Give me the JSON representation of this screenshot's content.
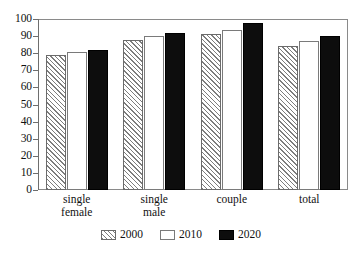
{
  "chart_data": {
    "type": "bar",
    "title": "",
    "subtitle": "",
    "xlabel": "",
    "ylabel": "",
    "categories": [
      "single\nfemale",
      "single\nmale",
      "couple",
      "total"
    ],
    "series": [
      {
        "name": "2000",
        "values": [
          79,
          87.5,
          91,
          84.5
        ],
        "style": "hatched",
        "color": "#ffffff",
        "hatch_color": "#7d7d7d",
        "border": "#6b6b6b"
      },
      {
        "name": "2010",
        "values": [
          80.5,
          90,
          93.5,
          87
        ],
        "style": "open",
        "color": "#ffffff",
        "border": "#7a7a7a"
      },
      {
        "name": "2020",
        "values": [
          82,
          92,
          97.5,
          90
        ],
        "style": "solid",
        "color": "#0d0d0d",
        "border": "#000000"
      }
    ],
    "ylim": [
      0,
      100
    ],
    "ytick_step": 10,
    "yticks": [
      0,
      10,
      20,
      30,
      40,
      50,
      60,
      70,
      80,
      90,
      100
    ],
    "ytick_labels": [
      "0",
      "10",
      "20",
      "30",
      "40",
      "50",
      "60",
      "70",
      "80",
      "90",
      "100"
    ],
    "grid": false,
    "legend_position": "bottom-center",
    "legend_entries": [
      "2000",
      "2010",
      "2020"
    ],
    "frame": true,
    "annotations": []
  },
  "axis": {
    "y": {
      "labels": [
        "100",
        "90",
        "80",
        "70",
        "60",
        "50",
        "40",
        "30",
        "20",
        "10",
        "0"
      ]
    },
    "x": {
      "group_labels": [
        "single\nfemale",
        "single\nmale",
        "couple",
        "total"
      ]
    }
  },
  "legend": {
    "items": [
      {
        "label": "2000",
        "swatch": "hatched-swatch-icon"
      },
      {
        "label": "2010",
        "swatch": "open-swatch-icon"
      },
      {
        "label": "2020",
        "swatch": "solid-swatch-icon"
      }
    ]
  }
}
